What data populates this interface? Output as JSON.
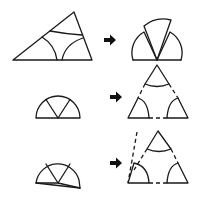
{
  "figure": {
    "description": "Proof that the angles of a triangle sum to 180 degrees: the three corner sectors of a triangle are cut off and rearranged into a half-disc (straight angle), and conversely a half-disc is split into three sectors placed at the corners of a triangle.",
    "stroke_color": "#1a1a1a",
    "arrow_color": "#111111",
    "background": "#ffffff"
  },
  "rows": [
    {
      "left": "triangle-with-three-corner-arcs",
      "arrow": "right-arrow",
      "right": "three-sectors-assembled-into-half-disc"
    },
    {
      "left": "half-disc-split-into-three-sectors",
      "arrow": "right-arrow",
      "right": "sectors-placed-at-triangle-corners-dashed-sides"
    },
    {
      "left": "half-disc-split-into-three-sectors-variant",
      "arrow": "right-arrow",
      "right": "sectors-at-triangle-corners-with-offset-dashed-side"
    }
  ]
}
